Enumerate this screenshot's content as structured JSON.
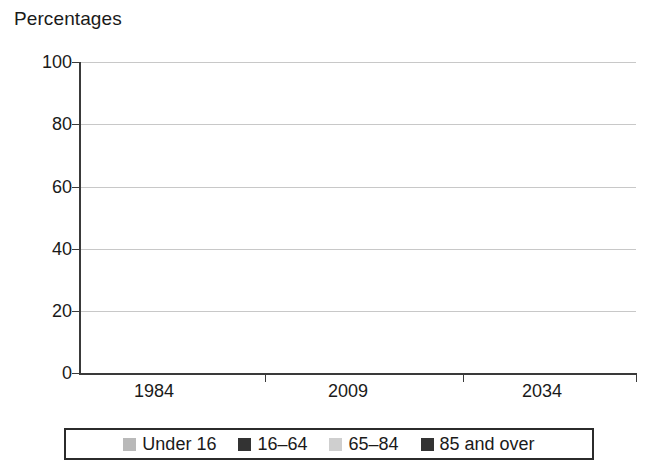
{
  "chart_data": {
    "type": "bar",
    "subtype": "stacked-100-percent",
    "title": "",
    "axis_title": "Percentages",
    "xlabel": "",
    "ylabel": "Percentages",
    "categories": [
      "1984",
      "2009",
      "2034"
    ],
    "series": [
      {
        "name": "Under 16",
        "values": [
          21,
          18,
          17
        ],
        "color": "#b9b9b9"
      },
      {
        "name": "16–64",
        "values": [
          64,
          65,
          59
        ],
        "color": "#333333"
      },
      {
        "name": "65–84",
        "values": [
          14,
          15,
          20
        ],
        "color": "#cfcfcf"
      },
      {
        "name": "85 and over",
        "values": [
          1,
          2,
          4
        ],
        "color": "#333333"
      }
    ],
    "cumulative_tops": {
      "1984": [
        21,
        85,
        99,
        100
      ],
      "2009": [
        18,
        83,
        98,
        100
      ],
      "2034": [
        17,
        76,
        96,
        100
      ]
    },
    "ylim": [
      0,
      100
    ],
    "yticks": [
      0,
      20,
      40,
      60,
      80,
      100
    ],
    "ytick_labels": [
      "0",
      "20",
      "40",
      "60",
      "80",
      "100"
    ],
    "grid": true,
    "grid_axis": "y",
    "legend_position": "bottom",
    "legend_entries": [
      "Under 16",
      "16–64",
      "65–84",
      "85 and over"
    ]
  },
  "legend": {
    "items": [
      {
        "label": "Under 16"
      },
      {
        "label": "16–64"
      },
      {
        "label": "65–84"
      },
      {
        "label": "85 and over"
      }
    ]
  },
  "axis": {
    "y_title": "Percentages",
    "y_labels": [
      "100",
      "80",
      "60",
      "40",
      "20",
      "0"
    ],
    "x_labels": [
      "1984",
      "2009",
      "2034"
    ]
  },
  "colors": {
    "under16": "#b9b9b9",
    "age16_64": "#333333",
    "age65_84": "#cfcfcf",
    "age85plus": "#333333",
    "gridline": "#c8c8c8",
    "axis": "#3a3a3a",
    "background": "#ffffff"
  }
}
